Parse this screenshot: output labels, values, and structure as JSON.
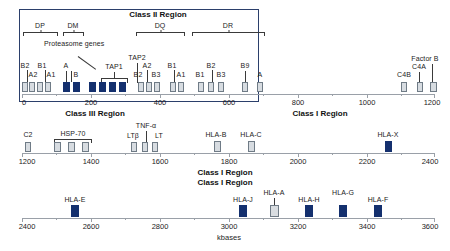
{
  "figure": {
    "axis_unit_label": "kbases",
    "colors": {
      "filled_gene": "#14306e",
      "open_gene": "#d7dce1",
      "gene_border": "#6f7b86",
      "panel_border": "#2b3f6b",
      "axis": "#9aa0a8"
    }
  },
  "panel": {
    "class2_label": "Class II Region"
  },
  "region_titles": {
    "class3": "Class III Region",
    "class1_row1": "Class I Region",
    "class1_row2": "Class I Region",
    "class1_row3": "Class I Region"
  },
  "brackets": [
    {
      "label": "DP",
      "start_kb": 0,
      "end_kb": 100
    },
    {
      "label": "DM",
      "start_kb": 120,
      "end_kb": 175
    },
    {
      "label": "DQ",
      "start_kb": 330,
      "end_kb": 470
    },
    {
      "label": "DR",
      "start_kb": 490,
      "end_kb": 700
    }
  ],
  "callouts": [
    {
      "label": "Proteasome genes",
      "target_kb": 205
    },
    {
      "label": "TAP1",
      "target_kb": 235
    },
    {
      "label": "TAP2",
      "target_kb": 285
    }
  ],
  "rows": [
    {
      "name": "row-1",
      "axis": {
        "min_kb": 0,
        "max_kb": 1200,
        "ticks": [
          0,
          200,
          400,
          600,
          800,
          1000,
          1200
        ]
      },
      "genes": [
        {
          "label": "B2",
          "kb": 8,
          "fill": "open"
        },
        {
          "label": "A2",
          "kb": 30,
          "fill": "open"
        },
        {
          "label": "B1",
          "kb": 52,
          "fill": "open"
        },
        {
          "label": "A1",
          "kb": 76,
          "fill": "open"
        },
        {
          "label": "A",
          "kb": 130,
          "fill": "filled"
        },
        {
          "label": "B",
          "kb": 158,
          "fill": "filled"
        },
        {
          "label": "",
          "kb": 205,
          "fill": "filled"
        },
        {
          "label": "",
          "kb": 233,
          "fill": "filled"
        },
        {
          "label": "",
          "kb": 261,
          "fill": "filled"
        },
        {
          "label": "",
          "kb": 288,
          "fill": "filled"
        },
        {
          "label": "B2",
          "kb": 337,
          "fill": "open"
        },
        {
          "label": "A2",
          "kb": 362,
          "fill": "open"
        },
        {
          "label": "B3",
          "kb": 388,
          "fill": "open"
        },
        {
          "label": "B1",
          "kb": 432,
          "fill": "open"
        },
        {
          "label": "A1",
          "kb": 457,
          "fill": "open"
        },
        {
          "label": "B1",
          "kb": 520,
          "fill": "open"
        },
        {
          "label": "B2",
          "kb": 550,
          "fill": "open"
        },
        {
          "label": "B3",
          "kb": 578,
          "fill": "open"
        },
        {
          "label": "B9",
          "kb": 648,
          "fill": "open"
        },
        {
          "label": "A",
          "kb": 690,
          "fill": "open"
        },
        {
          "label": "C4B",
          "kb": 1105,
          "fill": "open"
        },
        {
          "label": "C4A",
          "kb": 1152,
          "fill": "open"
        },
        {
          "label": "Factor B",
          "kb": 1190,
          "fill": "open"
        }
      ]
    },
    {
      "name": "row-2",
      "axis": {
        "min_kb": 1200,
        "max_kb": 2400,
        "ticks": [
          1200,
          1400,
          1600,
          1800,
          2000,
          2200,
          2400
        ]
      },
      "genes": [
        {
          "label": "C2",
          "kb": 1223,
          "fill": "open"
        },
        {
          "label": "",
          "kb": 1305,
          "fill": "open"
        },
        {
          "label": "",
          "kb": 1348,
          "fill": "open"
        },
        {
          "label": "",
          "kb": 1388,
          "fill": "open"
        },
        {
          "label": "LTβ",
          "kb": 1518,
          "fill": "open"
        },
        {
          "label": "",
          "kb": 1548,
          "fill": "open"
        },
        {
          "label": "LT",
          "kb": 1578,
          "fill": "open"
        },
        {
          "label": "HLA-B",
          "kb": 1762,
          "fill": "open"
        },
        {
          "label": "HLA-C",
          "kb": 1862,
          "fill": "open"
        },
        {
          "label": "HLA-X",
          "kb": 2270,
          "fill": "filled"
        }
      ],
      "brackets": [
        {
          "label": "HSP-70",
          "start_kb": 1295,
          "end_kb": 1400
        }
      ],
      "callouts": [
        {
          "label": "TNF-α",
          "target_kb": 1548
        }
      ]
    },
    {
      "name": "row-3",
      "axis": {
        "min_kb": 2400,
        "max_kb": 3600,
        "ticks": [
          2400,
          2600,
          2800,
          3000,
          3200,
          3400,
          3600
        ]
      },
      "genes": [
        {
          "label": "HLA-E",
          "kb": 2540,
          "fill": "filled"
        },
        {
          "label": "HLA-J",
          "kb": 3042,
          "fill": "filled"
        },
        {
          "label": "HLA-A",
          "kb": 3135,
          "fill": "light"
        },
        {
          "label": "HLA-H",
          "kb": 3238,
          "fill": "filled"
        },
        {
          "label": "HLA-G",
          "kb": 3338,
          "fill": "filled"
        },
        {
          "label": "HLA-F",
          "kb": 3438,
          "fill": "filled"
        }
      ]
    }
  ]
}
